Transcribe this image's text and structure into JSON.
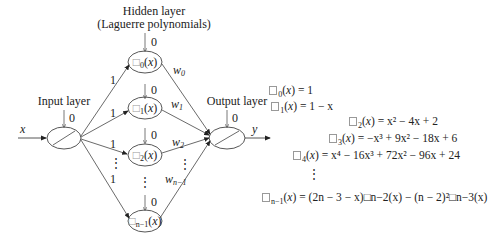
{
  "diagram": {
    "hidden_layer": {
      "title_line1": "Hidden layer",
      "title_line2": "(Laguerre polynomials)",
      "nodes": [
        {
          "label": "□",
          "sub": "0",
          "arg": "(x)",
          "bias": "0",
          "in_weight": "1",
          "out_weight": "w",
          "out_sub": "0"
        },
        {
          "label": "□",
          "sub": "1",
          "arg": "(x)",
          "bias": "0",
          "in_weight": "1",
          "out_weight": "w",
          "out_sub": "1"
        },
        {
          "label": "□",
          "sub": "2",
          "arg": "(x)",
          "bias": "0",
          "in_weight": "1",
          "out_weight": "w",
          "out_sub": "2"
        },
        {
          "label": "□",
          "sub": "n−1",
          "arg": "(x)",
          "bias": "0",
          "in_weight": "1",
          "out_weight": "w",
          "out_sub": "n−1"
        }
      ]
    },
    "input_layer": {
      "title": "Input layer",
      "bias": "0",
      "input_label": "x"
    },
    "output_layer": {
      "title": "Output layer",
      "bias": "0",
      "output_label": "y"
    },
    "ellipsis": "⋮"
  },
  "equations": [
    {
      "lhs_sub": "0",
      "rhs": "= 1"
    },
    {
      "lhs_sub": "1",
      "rhs": "= 1 − x"
    },
    {
      "lhs_sub": "2",
      "rhs": "= x² − 4x + 2"
    },
    {
      "lhs_sub": "3",
      "rhs": "= −x³ + 9x² − 18x + 6"
    },
    {
      "lhs_sub": "4",
      "rhs": "= x⁴ − 16x³ + 72x² − 96x + 24"
    },
    {
      "lhs_sub": "n−1",
      "rhs": "= (2n − 3 − x)□n−2(x) − (n − 2)²□n−3(x)"
    }
  ]
}
